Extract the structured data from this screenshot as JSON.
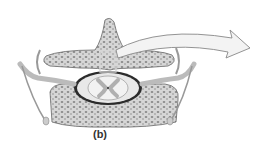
{
  "figure": {
    "caption": "(b)",
    "colors": {
      "bone": "#d4d4d4",
      "bone_dots": "#8a8a8a",
      "outline": "#555555",
      "cord_gray": "#b5b5b5",
      "cord_white": "#efefef",
      "arrow_fill": "#f2f2f2",
      "nerve": "#cfcfcf"
    }
  }
}
